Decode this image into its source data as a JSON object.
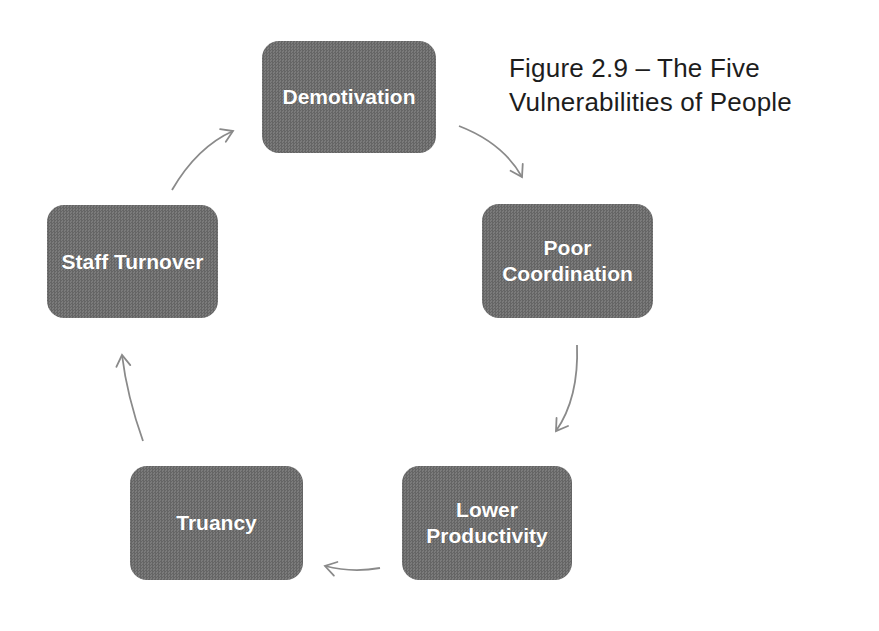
{
  "figure": {
    "title_line1": "Figure 2.9 – The Five",
    "title_line2": "Vulnerabilities of People"
  },
  "nodes": [
    {
      "label": "Demotivation"
    },
    {
      "label": "Poor Coordination"
    },
    {
      "label": "Lower Productivity"
    },
    {
      "label": "Truancy"
    },
    {
      "label": "Staff Turnover"
    }
  ],
  "cycle": {
    "type": "cycle-diagram",
    "direction": "clockwise",
    "sequence": [
      "Demotivation",
      "Poor Coordination",
      "Lower Productivity",
      "Truancy",
      "Staff Turnover"
    ]
  },
  "colors": {
    "node_fill_dark": "#656565",
    "node_fill_light": "#7b7b7b",
    "node_text": "#ffffff",
    "arrow": "#8a8a8a",
    "title_text": "#1d1d1d",
    "background": "#ffffff"
  }
}
